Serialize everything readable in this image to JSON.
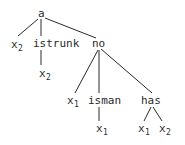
{
  "tree": {
    "root": {
      "label": "a",
      "children": [
        {
          "label": "x",
          "sub": "2"
        },
        {
          "label": "istrunk",
          "children": [
            {
              "label": "x",
              "sub": "2"
            }
          ]
        },
        {
          "label": "no",
          "children": [
            {
              "label": "x",
              "sub": "1"
            },
            {
              "label": "isman",
              "children": [
                {
                  "label": "x",
                  "sub": "1"
                }
              ]
            },
            {
              "label": "has",
              "children": [
                {
                  "label": "x",
                  "sub": "1"
                },
                {
                  "label": "x",
                  "sub": "2"
                }
              ]
            }
          ]
        }
      ]
    }
  },
  "nodes": {
    "a": "a",
    "x2_left": "x",
    "x2_left_sub": "2",
    "istrunk": "istrunk",
    "istrunk_child": "x",
    "istrunk_child_sub": "2",
    "no": "no",
    "no_x1": "x",
    "no_x1_sub": "1",
    "isman": "isman",
    "isman_child": "x",
    "isman_child_sub": "1",
    "has": "has",
    "has_x1": "x",
    "has_x1_sub": "1",
    "has_x2": "x",
    "has_x2_sub": "2"
  },
  "colors": {
    "ink": "#2a2a2a",
    "background": "#ffffff"
  }
}
